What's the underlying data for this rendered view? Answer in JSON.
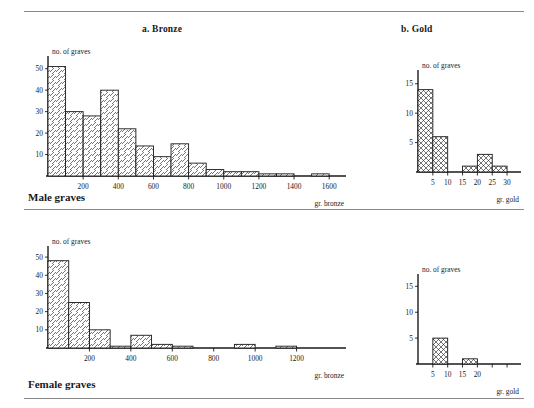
{
  "page": {
    "rules": [
      "top-rule",
      "middle-rule",
      "bottom-rule"
    ],
    "sections": [
      {
        "label": "Male graves"
      },
      {
        "label": "Female graves"
      }
    ]
  },
  "chart_data": [
    {
      "id": "male-bronze",
      "type": "bar",
      "title": "a. Bronze",
      "xlabel": "gr. bronze",
      "ylabel": "no. of graves",
      "hatch": "diagonal",
      "bin_width": 100,
      "xlim": [
        0,
        1650
      ],
      "ylim": [
        0,
        55
      ],
      "xticks": [
        200,
        400,
        600,
        800,
        1000,
        1200,
        1400,
        1600
      ],
      "xtick_labels": [
        "200",
        "400",
        "600",
        "800",
        "1000",
        "1200",
        "1400",
        "1600"
      ],
      "yticks": [
        10,
        20,
        30,
        40,
        50
      ],
      "ytick_labels": [
        "10",
        "20",
        "30",
        "40",
        "50"
      ],
      "bin_starts": [
        0,
        100,
        200,
        300,
        400,
        500,
        600,
        700,
        800,
        900,
        1000,
        1100,
        1200,
        1300,
        1400,
        1500
      ],
      "values": [
        51,
        30,
        28,
        40,
        22,
        14,
        9,
        15,
        6,
        3,
        2,
        2,
        1,
        1,
        0,
        1
      ],
      "grid": false,
      "legend": "none"
    },
    {
      "id": "male-gold",
      "type": "bar",
      "title": "b. Gold",
      "xlabel": "gr. gold",
      "ylabel": "no. of graves",
      "hatch": "cross",
      "bin_width": 5,
      "xlim": [
        0,
        32
      ],
      "ylim": [
        0,
        17
      ],
      "xticks": [
        5,
        10,
        15,
        20,
        25,
        30
      ],
      "xtick_labels": [
        "5",
        "10",
        "15",
        "20",
        "25",
        "30"
      ],
      "yticks": [
        5,
        10,
        15
      ],
      "ytick_labels": [
        "5",
        "10",
        "15"
      ],
      "bin_starts": [
        0,
        5,
        10,
        15,
        20,
        25
      ],
      "values": [
        14,
        6,
        0,
        1,
        3,
        1
      ],
      "grid": false,
      "legend": "none"
    },
    {
      "id": "female-bronze",
      "type": "bar",
      "title": "",
      "xlabel": "gr. bronze",
      "ylabel": "no. of graves",
      "hatch": "diagonal",
      "bin_width": 100,
      "xlim": [
        0,
        1400
      ],
      "ylim": [
        0,
        55
      ],
      "xticks": [
        200,
        400,
        600,
        800,
        1000,
        1200
      ],
      "xtick_labels": [
        "200",
        "400",
        "600",
        "800",
        "1000",
        "1200"
      ],
      "yticks": [
        10,
        20,
        30,
        40,
        50
      ],
      "ytick_labels": [
        "10",
        "20",
        "30",
        "40",
        "50"
      ],
      "bin_starts": [
        0,
        100,
        200,
        300,
        400,
        500,
        600,
        700,
        800,
        900,
        1000,
        1100,
        1200
      ],
      "values": [
        48,
        25,
        10,
        1,
        7,
        2,
        1,
        0,
        0,
        2,
        0,
        1,
        0
      ],
      "grid": false,
      "legend": "none"
    },
    {
      "id": "female-gold",
      "type": "bar",
      "title": "",
      "xlabel": "gr. gold",
      "ylabel": "no. of graves",
      "hatch": "cross",
      "bin_width": 5,
      "xlim": [
        0,
        32
      ],
      "ylim": [
        0,
        17
      ],
      "xticks": [
        5,
        10,
        15,
        20,
        25,
        30
      ],
      "xtick_labels": [
        "5",
        "10",
        "15",
        "20"
      ],
      "yticks": [
        5,
        10,
        15
      ],
      "ytick_labels": [
        "5",
        "10",
        "15"
      ],
      "bin_starts": [
        0,
        5,
        10,
        15,
        20,
        25
      ],
      "values": [
        0,
        5,
        0,
        1,
        0,
        0
      ],
      "grid": false,
      "legend": "none"
    }
  ]
}
